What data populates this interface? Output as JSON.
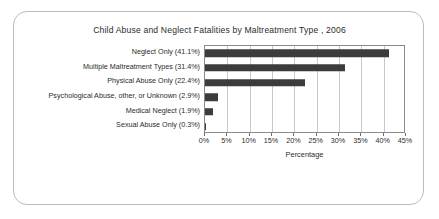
{
  "card": {
    "border_color": "#bcbcbc",
    "background": "#ffffff"
  },
  "chart_data": {
    "type": "bar",
    "orientation": "horizontal",
    "title": "Child Abuse and Neglect Fatalities by Maltreatment Type , 2006",
    "xlabel": "Percentage",
    "ylabel": "",
    "categories": [
      "Neglect Only (41.1%)",
      "Multiple Maltreatment Types (31.4%)",
      "Physical Abuse Only (22.4%)",
      "Psychological Abuse, other, or Unknown (2.9%)",
      "Medical Neglect (1.9%)",
      "Sexual Abuse Only (0.3%)"
    ],
    "values": [
      41.1,
      31.4,
      22.4,
      2.9,
      1.9,
      0.3
    ],
    "xlim": [
      0,
      45
    ],
    "xticks": [
      0,
      5,
      10,
      15,
      20,
      25,
      30,
      35,
      40,
      45
    ],
    "xticklabels": [
      "0%",
      "5%",
      "10%",
      "15%",
      "20%",
      "25%",
      "30%",
      "35%",
      "40%",
      "45%"
    ],
    "grid": "vertical",
    "legend": "none",
    "bar_color": "#3c3c3c",
    "grid_color": "#c9c9c9",
    "axis_color": "#8a8a8a"
  }
}
